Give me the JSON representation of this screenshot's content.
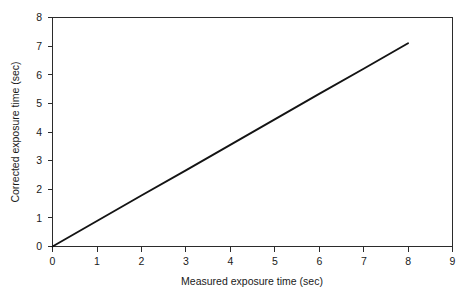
{
  "chart_data": {
    "type": "line",
    "title": "",
    "subtitle": "",
    "xlabel": "Measured exposure time (sec)",
    "ylabel": "Corrected exposure time (sec)",
    "xlim": [
      0,
      9
    ],
    "ylim": [
      0,
      8
    ],
    "xticks": [
      "0",
      "1",
      "2",
      "3",
      "4",
      "5",
      "6",
      "7",
      "8",
      "9"
    ],
    "yticks": [
      "0",
      "1",
      "2",
      "3",
      "4",
      "5",
      "6",
      "7",
      "8"
    ],
    "xtick_values": [
      0,
      1,
      2,
      3,
      4,
      5,
      6,
      7,
      8,
      9
    ],
    "ytick_values": [
      0,
      1,
      2,
      3,
      4,
      5,
      6,
      7,
      8
    ],
    "grid": false,
    "legend": null,
    "legend_position": "none",
    "line_color": "#141414",
    "frame_color": "#2b2b2b",
    "background_color": "#ffffff",
    "series": [
      {
        "name": "corrected vs measured exposure time",
        "x": [
          0,
          1,
          2,
          3,
          4,
          5,
          6,
          7,
          8
        ],
        "values": [
          0.0,
          0.89,
          1.78,
          2.66,
          3.55,
          4.44,
          5.33,
          6.21,
          7.1
        ]
      }
    ],
    "annotations": []
  }
}
